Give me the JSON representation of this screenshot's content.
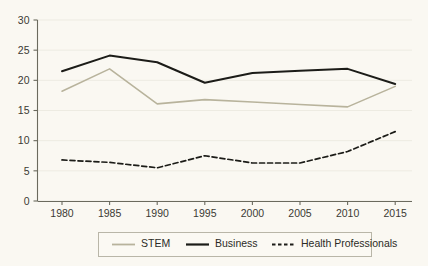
{
  "chart_data": {
    "type": "line",
    "title": "",
    "subtitle": "",
    "xlabel": "",
    "ylabel": "",
    "x": [
      1980,
      1985,
      1990,
      1995,
      2000,
      2005,
      2010,
      2015
    ],
    "xtick_labels": [
      "1980",
      "1985",
      "1990",
      "1995",
      "2000",
      "2005",
      "2010",
      "2015"
    ],
    "ytick_labels": [
      "0",
      "5",
      "10",
      "15",
      "20",
      "25",
      "30"
    ],
    "yticks": [
      0,
      5,
      10,
      15,
      20,
      25,
      30
    ],
    "xlim": [
      1977.5,
      2017.5
    ],
    "ylim": [
      0,
      30
    ],
    "grid": true,
    "grid_axis": "y",
    "legend_position": "bottom-center",
    "background_color": "#faf8f2",
    "axis_color": "#6b6a5e",
    "grid_color": "#edebe2",
    "series": [
      {
        "name": "STEM",
        "values": [
          18.2,
          21.9,
          16.1,
          16.8,
          16.4,
          16.0,
          15.6,
          19.0
        ],
        "color": "#b8b39c",
        "style": "solid",
        "width": 1.6
      },
      {
        "name": "Business",
        "values": [
          21.5,
          24.1,
          23.0,
          19.6,
          21.2,
          21.6,
          21.9,
          19.4
        ],
        "color": "#1c1c18",
        "style": "solid",
        "width": 2.0
      },
      {
        "name": "Health Professionals",
        "values": [
          6.8,
          6.4,
          5.5,
          7.5,
          6.3,
          6.3,
          8.2,
          11.5
        ],
        "color": "#1c1c18",
        "style": "dashed",
        "width": 1.7,
        "dash_pattern": "5,3"
      }
    ]
  },
  "legend": {
    "entries": [
      {
        "label": "STEM"
      },
      {
        "label": "Business"
      },
      {
        "label": "Health Professionals"
      }
    ]
  }
}
